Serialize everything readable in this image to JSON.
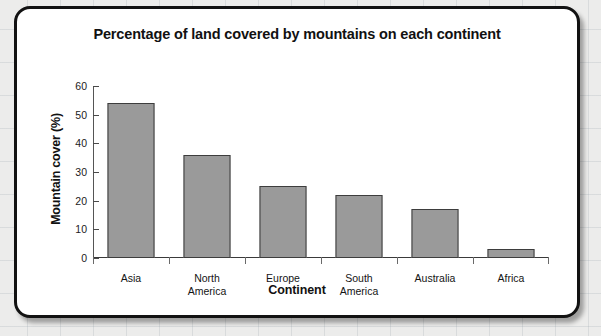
{
  "chart_data": {
    "type": "bar",
    "title": "Percentage of land covered by mountains on each continent",
    "xlabel": "Continent",
    "ylabel": "Mountain cover (%)",
    "categories": [
      "Asia",
      "North America",
      "Europe",
      "South America",
      "Australia",
      "Africa"
    ],
    "values": [
      54,
      36,
      25,
      22,
      17,
      3
    ],
    "ylim": [
      0,
      60
    ],
    "yticks": [
      0,
      10,
      20,
      30,
      40,
      50,
      60
    ],
    "ytick_labels": [
      "0",
      "10",
      "20",
      "30",
      "40",
      "50",
      "60"
    ],
    "grid": false,
    "legend": "none",
    "bar_color": "#9a9a9a",
    "bar_border_color": "#3d3d3d",
    "axis_color": "#3a3a3a",
    "card_border_color": "#121212",
    "card_background": "#ffffff",
    "page_background": "#ececeb",
    "category_lines": [
      [
        "Asia"
      ],
      [
        "North",
        "America"
      ],
      [
        "Europe"
      ],
      [
        "South",
        "America"
      ],
      [
        "Australia"
      ],
      [
        "Africa"
      ]
    ]
  }
}
